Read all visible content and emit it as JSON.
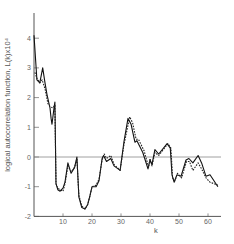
{
  "chart_data": {
    "type": "line",
    "title": "",
    "xlabel": "k",
    "ylabel": "logical autocorrelation function, L(k)x10⁴",
    "xlim": [
      0,
      64
    ],
    "ylim": [
      -2,
      4.8
    ],
    "xticks": [
      10,
      20,
      30,
      40,
      50,
      60
    ],
    "yticks": [
      -2,
      -1,
      0,
      1,
      2,
      3,
      4
    ],
    "xtick_labels": [
      "10",
      "20",
      "30",
      "40",
      "50",
      "60"
    ],
    "ytick_labels": [
      "-2",
      "-1",
      "0",
      "1",
      "2",
      "3",
      "4"
    ],
    "grid": false,
    "reference_line": 0,
    "legend": null,
    "series": [
      {
        "name": "solid",
        "style": "solid",
        "x": [
          0,
          1,
          2,
          3,
          3.8,
          4.5,
          5.5,
          5.9,
          6.2,
          6.9,
          7.2,
          7.6,
          8.2,
          9,
          10,
          10.7,
          11.7,
          12.8,
          14,
          14.8,
          15.5,
          16.5,
          17.6,
          18.5,
          19.3,
          20,
          21.4,
          22.4,
          23.5,
          24,
          25,
          26.5,
          27.6,
          29.7,
          31,
          32.4,
          33.5,
          34.8,
          35.5,
          36.5,
          37.5,
          39.3,
          40,
          40.7,
          41.7,
          43,
          45.9,
          47,
          47.6,
          48.3,
          49.3,
          50.7,
          52.4,
          53.4,
          54.8,
          56.6,
          57.8,
          59.3,
          60.7,
          63.4
        ],
        "y": [
          4.1,
          2.6,
          2.5,
          3.0,
          2.5,
          2.1,
          1.65,
          1.3,
          1.1,
          1.65,
          1.85,
          -0.9,
          -1.1,
          -1.15,
          -1.05,
          -0.85,
          -0.2,
          -0.55,
          -0.35,
          0.0,
          -1.35,
          -1.7,
          -1.75,
          -1.6,
          -1.3,
          -1.0,
          -1.0,
          -0.8,
          -0.05,
          0.05,
          -0.15,
          -0.05,
          -0.3,
          -0.45,
          0.5,
          1.3,
          1.1,
          0.5,
          0.55,
          0.35,
          0.15,
          -0.4,
          -0.1,
          -0.25,
          0.25,
          0.1,
          0.45,
          0.3,
          -0.6,
          -0.85,
          -0.6,
          -0.65,
          -0.1,
          -0.05,
          -0.2,
          0.05,
          -0.2,
          -0.65,
          -0.6,
          -1.0
        ]
      },
      {
        "name": "dashed",
        "style": "dashed",
        "x": [
          0.3,
          1,
          2,
          2.8,
          3.8,
          4.8,
          5.5,
          6.5,
          7.2,
          7.6,
          8.2,
          9,
          10,
          10.7,
          11.7,
          12.8,
          14,
          14.8,
          15.5,
          16.5,
          17.6,
          18.5,
          19.3,
          20,
          21.4,
          22.4,
          23.5,
          24.2,
          25,
          26.5,
          27.6,
          29.7,
          31,
          33,
          34,
          35.2,
          36,
          37,
          38,
          39.5,
          40,
          40.7,
          41.7,
          43,
          46.2,
          47.2,
          47.8,
          48.6,
          49.5,
          50.9,
          52.6,
          53.6,
          54.8,
          56.6,
          57.8,
          59.3,
          60.7,
          63.4
        ],
        "y": [
          2.85,
          2.65,
          2.5,
          2.6,
          2.3,
          1.8,
          1.7,
          1.65,
          1.75,
          -0.9,
          -1.05,
          -1.1,
          -1.15,
          -0.9,
          -0.3,
          -0.5,
          -0.35,
          -0.05,
          -1.3,
          -1.65,
          -1.75,
          -1.6,
          -1.3,
          -1.0,
          -0.95,
          -0.75,
          -0.1,
          0.1,
          -0.05,
          0.05,
          -0.25,
          -0.45,
          0.4,
          1.35,
          1.15,
          0.6,
          0.6,
          0.4,
          0.2,
          -0.35,
          -0.05,
          -0.3,
          0.15,
          0.05,
          0.45,
          0.3,
          -0.7,
          -0.8,
          -0.55,
          -0.7,
          -0.15,
          -0.15,
          -0.45,
          -0.2,
          -0.4,
          -0.7,
          -0.85,
          -0.95
        ]
      }
    ]
  }
}
